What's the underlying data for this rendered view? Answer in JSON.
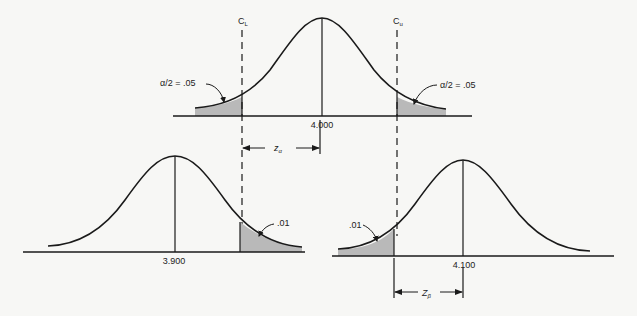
{
  "diagram": {
    "type": "hypothesis-test-normal-distributions",
    "colors": {
      "line": "#1a1a1a",
      "shade": "#b9b9b9",
      "background": "#f7f7f5"
    },
    "top_curve": {
      "mean_label": "4.000",
      "lower_critical_label": "C",
      "lower_critical_sub": "L",
      "upper_critical_label": "C",
      "upper_critical_sub": "u",
      "left_tail_label": "α/2 = .05",
      "right_tail_label": "α/2 = .05"
    },
    "bottom_left_curve": {
      "mean_label": "3.900",
      "tail_label": ".01"
    },
    "bottom_right_curve": {
      "mean_label": "4.100",
      "tail_label": ".01"
    },
    "z_alpha": {
      "label": "z",
      "sub": "α"
    },
    "z_beta": {
      "label": "Z",
      "sub": "β"
    }
  }
}
